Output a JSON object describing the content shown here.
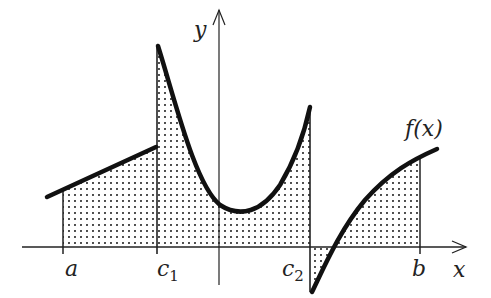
{
  "diagram": {
    "title": "",
    "axes": {
      "x_label": "x",
      "y_label": "y"
    },
    "function_label": "f(x)",
    "tick_labels": [
      {
        "name": "a",
        "text": "a",
        "sub": ""
      },
      {
        "name": "c1",
        "text": "c",
        "sub": "1"
      },
      {
        "name": "c2",
        "text": "c",
        "sub": "2"
      },
      {
        "name": "b",
        "text": "b",
        "sub": ""
      }
    ],
    "colors": {
      "curve": "#111111",
      "axis": "#222222",
      "dots": "#222222",
      "background": "#ffffff"
    }
  }
}
